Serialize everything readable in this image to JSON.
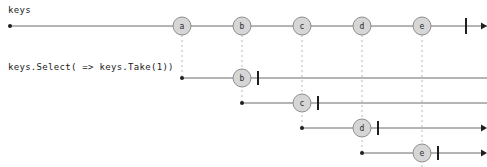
{
  "diagram": {
    "type": "marble-diagram",
    "width": 487,
    "height": 167,
    "background_color": "#ffffff",
    "marble_fill_color": "#d6d6d6",
    "marble_stroke_color": "#8d8d8d",
    "timeline_color": "#6b6b6b",
    "guide_color": "#b9b9b9",
    "marker_color": "#1f1f1f"
  },
  "source": {
    "label": "keys",
    "label_x": 8,
    "label_y": 13,
    "axis_y": 26,
    "start_x": 10,
    "end_x": 487,
    "complete_bar_x": 466,
    "arrow_x": 481,
    "marbles": [
      {
        "value": "a",
        "x": 182
      },
      {
        "value": "b",
        "x": 242
      },
      {
        "value": "c",
        "x": 302
      },
      {
        "value": "d",
        "x": 362
      },
      {
        "value": "e",
        "x": 422
      }
    ]
  },
  "operator": {
    "label": "keys.Select( => keys.Take(1))",
    "label_x": 8,
    "label_y": 70
  },
  "results": [
    {
      "source_value": "a",
      "start_x": 182,
      "axis_y": 78,
      "marble": {
        "value": "b",
        "x": 242
      },
      "complete_bar_x": 258,
      "end_x": 487,
      "arrow": false
    },
    {
      "source_value": "b",
      "start_x": 242,
      "axis_y": 103,
      "marble": {
        "value": "c",
        "x": 302
      },
      "complete_bar_x": 318,
      "end_x": 487,
      "arrow": false
    },
    {
      "source_value": "c",
      "start_x": 302,
      "axis_y": 128,
      "marble": {
        "value": "d",
        "x": 362
      },
      "complete_bar_x": 378,
      "end_x": 481,
      "arrow": true
    },
    {
      "source_value": "d",
      "start_x": 362,
      "axis_y": 153,
      "marble": {
        "value": "e",
        "x": 422
      },
      "complete_bar_x": 438,
      "end_x": 481,
      "arrow": true
    }
  ],
  "guides": [
    {
      "x": 182,
      "y1": 35,
      "y2": 78
    },
    {
      "x": 242,
      "y1": 35,
      "y2": 103
    },
    {
      "x": 302,
      "y1": 35,
      "y2": 128
    },
    {
      "x": 362,
      "y1": 35,
      "y2": 153
    },
    {
      "x": 422,
      "y1": 35,
      "y2": 167
    }
  ]
}
